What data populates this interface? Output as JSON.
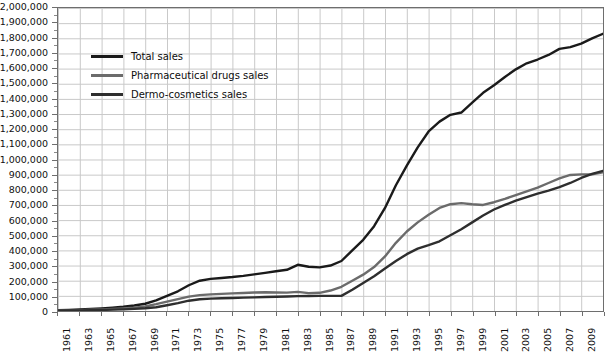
{
  "chart_data": {
    "type": "line",
    "title": "",
    "xlabel": "",
    "ylabel": "",
    "grid": true,
    "legend_position": "upper-left-inside",
    "xlim": [
      1961,
      2011
    ],
    "ylim": [
      0,
      2000000
    ],
    "ytick_step": 100000,
    "xtick_step": 2,
    "x": [
      1961,
      1962,
      1963,
      1964,
      1965,
      1966,
      1967,
      1968,
      1969,
      1970,
      1971,
      1972,
      1973,
      1974,
      1975,
      1976,
      1977,
      1978,
      1979,
      1980,
      1981,
      1982,
      1983,
      1984,
      1985,
      1986,
      1987,
      1988,
      1989,
      1990,
      1991,
      1992,
      1993,
      1994,
      1995,
      1996,
      1997,
      1998,
      1999,
      2000,
      2001,
      2002,
      2003,
      2004,
      2005,
      2006,
      2007,
      2008,
      2009,
      2010,
      2011
    ],
    "y_ticks": [
      "0",
      "100,000",
      "200,000",
      "300,000",
      "400,000",
      "500,000",
      "600,000",
      "700,000",
      "800,000",
      "900,000",
      "1,000,000",
      "1,100,000",
      "1,200,000",
      "1,300,000",
      "1,400,000",
      "1,500,000",
      "1,600,000",
      "1,700,000",
      "1,800,000",
      "1,900,000",
      "2,000,000"
    ],
    "x_ticks": [
      "1961",
      "1963",
      "1965",
      "1967",
      "1969",
      "1971",
      "1973",
      "1975",
      "1977",
      "1979",
      "1981",
      "1983",
      "1985",
      "1987",
      "1989",
      "1991",
      "1993",
      "1995",
      "1997",
      "1999",
      "2001",
      "2003",
      "2005",
      "2007",
      "2009"
    ],
    "series": [
      {
        "name": "Total sales",
        "color": "#1a1a1a",
        "width": 2.4,
        "values": [
          5000,
          7000,
          10000,
          13000,
          17000,
          22000,
          28000,
          36000,
          48000,
          70000,
          100000,
          130000,
          170000,
          200000,
          212000,
          218000,
          224000,
          232000,
          242000,
          252000,
          262000,
          272000,
          305000,
          292000,
          288000,
          300000,
          330000,
          400000,
          470000,
          560000,
          680000,
          830000,
          960000,
          1080000,
          1185000,
          1250000,
          1295000,
          1310000,
          1375000,
          1440000,
          1490000,
          1545000,
          1595000,
          1635000,
          1660000,
          1690000,
          1730000,
          1742000,
          1765000,
          1800000,
          1830000
        ]
      },
      {
        "name": "Pharmaceutical drugs sales",
        "color": "#6b6b6b",
        "width": 2.4,
        "values": [
          3000,
          4000,
          6000,
          8000,
          10000,
          13000,
          17000,
          22000,
          30000,
          45000,
          62000,
          78000,
          95000,
          105000,
          110000,
          113000,
          116000,
          119000,
          122000,
          124000,
          122000,
          121000,
          126000,
          118000,
          120000,
          135000,
          160000,
          200000,
          240000,
          290000,
          360000,
          450000,
          525000,
          585000,
          635000,
          680000,
          705000,
          712000,
          705000,
          700000,
          718000,
          740000,
          765000,
          790000,
          815000,
          845000,
          875000,
          898000,
          902000,
          903000,
          915000
        ]
      },
      {
        "name": "Dermo-cosmetics sales",
        "color": "#2e2e2e",
        "width": 2.4,
        "values": [
          2000,
          3000,
          4000,
          5000,
          7000,
          9000,
          11000,
          14000,
          18000,
          25000,
          38000,
          52000,
          68000,
          78000,
          82000,
          84000,
          86000,
          88000,
          90000,
          92000,
          94000,
          96000,
          98000,
          99000,
          100000,
          100000,
          100000,
          140000,
          185000,
          230000,
          280000,
          330000,
          375000,
          412000,
          435000,
          460000,
          500000,
          540000,
          585000,
          630000,
          670000,
          700000,
          728000,
          752000,
          775000,
          795000,
          818000,
          845000,
          878000,
          905000,
          925000
        ]
      }
    ]
  },
  "legend": {
    "items": [
      {
        "label": "Total sales",
        "color": "#1a1a1a"
      },
      {
        "label": "Pharmaceutical drugs sales",
        "color": "#6b6b6b"
      },
      {
        "label": "Dermo-cosmetics sales",
        "color": "#2e2e2e"
      }
    ]
  },
  "colors": {
    "total_sales": "#1a1a1a",
    "pharmaceutical_drugs_sales": "#6b6b6b",
    "dermo_cosmetics_sales": "#2e2e2e",
    "grid": "#c9c9c9",
    "axis": "#6e6e6e",
    "background": "#ffffff",
    "text": "#111111"
  }
}
